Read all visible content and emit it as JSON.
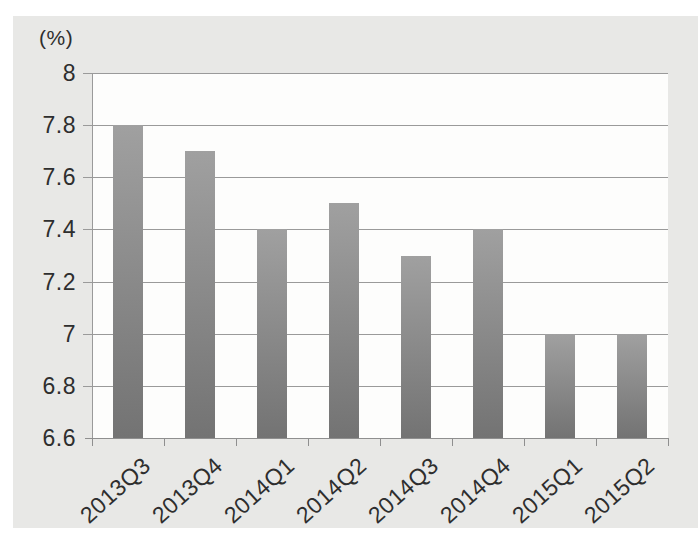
{
  "chart_data": {
    "type": "bar",
    "title": "",
    "xlabel": "",
    "ylabel": "(%)",
    "categories": [
      "2013Q3",
      "2013Q4",
      "2014Q1",
      "2014Q2",
      "2014Q3",
      "2014Q4",
      "2015Q1",
      "2015Q2"
    ],
    "values": [
      7.8,
      7.7,
      7.4,
      7.5,
      7.3,
      7.4,
      7.0,
      7.0
    ],
    "ylim": [
      6.6,
      8.0
    ],
    "ytick_step": 0.2,
    "ytick_labels": [
      "8",
      "7.8",
      "7.6",
      "7.4",
      "7.2",
      "7",
      "6.8",
      "6.6"
    ],
    "grid": true,
    "legend": false,
    "colors": {
      "panel_bg": "#e8e8e6",
      "plot_bg": "#fdfdfc",
      "gridline": "#9a9a9a",
      "axis": "#8f8f8f",
      "text": "#2e2e2e",
      "bar_top": "#a0a0a0",
      "bar_bottom": "#737373"
    }
  }
}
